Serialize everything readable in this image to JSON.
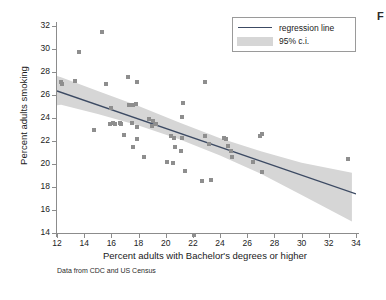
{
  "figure": {
    "caption_fragment": "F",
    "source_note": "Data from CDC and US Census"
  },
  "legend": {
    "position": "top-right",
    "items": [
      {
        "label": "regression line",
        "key": "line",
        "color": "#3c4a63"
      },
      {
        "label": "95% c.i.",
        "key": "band",
        "color": "#d6d6d6"
      }
    ]
  },
  "colors": {
    "marker": "#8e8e8e",
    "regression_line": "#3c4a63",
    "confidence_band": "#d6d6d6",
    "axis": "#8c8c8c",
    "background": "#ffffff"
  },
  "chart_data": {
    "type": "scatter",
    "title": "",
    "xlabel": "Percent adults with Bachelor's degrees or higher",
    "ylabel": "Percent adults smoking",
    "xlim": [
      12,
      34
    ],
    "ylim": [
      14,
      32
    ],
    "xticks": [
      12,
      14,
      16,
      18,
      20,
      22,
      24,
      26,
      28,
      30,
      32,
      34
    ],
    "yticks": [
      14,
      16,
      18,
      20,
      22,
      24,
      26,
      28,
      30,
      32
    ],
    "grid": false,
    "annotation": "Data from CDC and US Census",
    "series": [
      {
        "name": "states",
        "type": "scatter",
        "marker": "square",
        "points": [
          [
            12.3,
            27.1
          ],
          [
            12.4,
            27.0
          ],
          [
            13.3,
            27.2
          ],
          [
            13.6,
            29.7
          ],
          [
            14.7,
            23.0
          ],
          [
            15.3,
            31.5
          ],
          [
            15.6,
            27.0
          ],
          [
            15.9,
            23.5
          ],
          [
            16.1,
            23.6
          ],
          [
            16.3,
            23.5
          ],
          [
            16.6,
            23.6
          ],
          [
            16.7,
            23.5
          ],
          [
            16.0,
            24.9
          ],
          [
            17.2,
            27.6
          ],
          [
            17.3,
            25.1
          ],
          [
            17.6,
            25.1
          ],
          [
            17.9,
            27.1
          ],
          [
            17.8,
            25.2
          ],
          [
            17.5,
            23.6
          ],
          [
            17.9,
            23.2
          ],
          [
            16.9,
            22.5
          ],
          [
            17.6,
            21.5
          ],
          [
            17.9,
            22.2
          ],
          [
            18.4,
            20.6
          ],
          [
            18.8,
            23.9
          ],
          [
            19.1,
            23.7
          ],
          [
            19.3,
            23.5
          ],
          [
            19.0,
            23.3
          ],
          [
            20.1,
            20.2
          ],
          [
            20.5,
            20.1
          ],
          [
            20.4,
            22.4
          ],
          [
            20.6,
            22.3
          ],
          [
            20.7,
            21.5
          ],
          [
            21.1,
            21.1
          ],
          [
            21.2,
            22.3
          ],
          [
            21.3,
            25.3
          ],
          [
            21.2,
            24.1
          ],
          [
            21.4,
            19.4
          ],
          [
            22.1,
            13.8
          ],
          [
            22.7,
            18.5
          ],
          [
            22.9,
            27.1
          ],
          [
            22.9,
            22.4
          ],
          [
            23.2,
            21.7
          ],
          [
            23.3,
            18.6
          ],
          [
            24.3,
            22.3
          ],
          [
            24.4,
            22.2
          ],
          [
            24.6,
            21.6
          ],
          [
            24.8,
            21.1
          ],
          [
            24.9,
            20.6
          ],
          [
            26.4,
            20.2
          ],
          [
            26.9,
            22.4
          ],
          [
            27.1,
            22.6
          ],
          [
            27.1,
            19.3
          ],
          [
            33.4,
            20.4
          ]
        ]
      },
      {
        "name": "regression line",
        "type": "line",
        "endpoints": [
          [
            12.0,
            26.35
          ],
          [
            34.0,
            17.4
          ]
        ],
        "slope": -0.407,
        "intercept": 31.23
      },
      {
        "name": "95% c.i.",
        "type": "band",
        "x": [
          12.0,
          12.3,
          15.0,
          18.0,
          21.0,
          24.0,
          27.0,
          30.0,
          33.7
        ],
        "upper": [
          27.65,
          27.55,
          26.35,
          25.05,
          23.6,
          22.25,
          21.1,
          20.1,
          19.25
        ],
        "lower": [
          25.1,
          25.15,
          24.35,
          23.35,
          22.15,
          20.75,
          19.15,
          17.3,
          15.0
        ]
      }
    ]
  },
  "axes": {
    "x_tick_labels": [
      "12",
      "14",
      "16",
      "18",
      "20",
      "22",
      "24",
      "26",
      "28",
      "30",
      "32",
      "34"
    ],
    "y_tick_labels": [
      "14",
      "16",
      "18",
      "20",
      "22",
      "24",
      "26",
      "28",
      "30",
      "32"
    ]
  }
}
